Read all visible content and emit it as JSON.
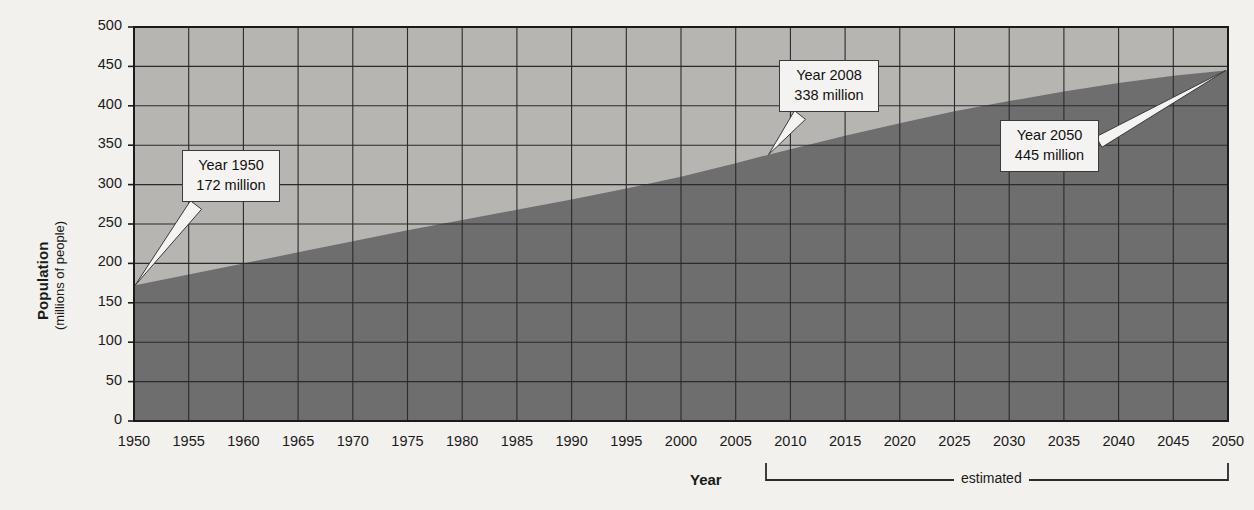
{
  "chart_data": {
    "type": "area",
    "title": "",
    "xlabel": "Year",
    "ylabel": "Population",
    "ylabel_sub": "(millions of people)",
    "xlim": [
      1950,
      2050
    ],
    "ylim": [
      0,
      500
    ],
    "grid": true,
    "legend": "none",
    "y_ticks": [
      "500",
      "450",
      "400",
      "350",
      "300",
      "250",
      "200",
      "150",
      "100",
      "50",
      "0"
    ],
    "y_tick_values": [
      500,
      450,
      400,
      350,
      300,
      250,
      200,
      150,
      100,
      50,
      0
    ],
    "x_ticks": [
      "1950",
      "1955",
      "1960",
      "1965",
      "1970",
      "1975",
      "1980",
      "1985",
      "1990",
      "1995",
      "2000",
      "2005",
      "2010",
      "2015",
      "2020",
      "2025",
      "2030",
      "2035",
      "2040",
      "2045",
      "2050"
    ],
    "x_tick_values": [
      1950,
      1955,
      1960,
      1965,
      1970,
      1975,
      1980,
      1985,
      1990,
      1995,
      2000,
      2005,
      2010,
      2015,
      2020,
      2025,
      2030,
      2035,
      2040,
      2045,
      2050
    ],
    "series": [
      {
        "name": "Population",
        "x": [
          1950,
          1955,
          1960,
          1965,
          1970,
          1975,
          1980,
          1985,
          1990,
          1995,
          2000,
          2005,
          2008,
          2010,
          2015,
          2020,
          2025,
          2030,
          2035,
          2040,
          2045,
          2050
        ],
        "values": [
          172,
          186,
          200,
          214,
          228,
          242,
          255,
          268,
          281,
          295,
          310,
          327,
          338,
          345,
          362,
          378,
          393,
          406,
          418,
          429,
          438,
          445
        ]
      }
    ],
    "annotations": [
      {
        "id": "callout-1950",
        "line1": "Year 1950",
        "line2": "172 million",
        "year": 1950,
        "value": 172
      },
      {
        "id": "callout-2008",
        "line1": "Year 2008",
        "line2": "338 million",
        "year": 2008,
        "value": 338
      },
      {
        "id": "callout-2050",
        "line1": "Year 2050",
        "line2": "445 million",
        "year": 2050,
        "value": 445
      }
    ],
    "estimated_bracket": {
      "label": "estimated",
      "from_year": 2008,
      "to_year": 2050
    },
    "colors": {
      "area_fill": "#6e6e6e",
      "plot_background": "#b6b5b2",
      "grid": "#2b2b2b",
      "axis": "#1a1a1a",
      "page_background": "#f2f1ee",
      "callout_background": "#f4f3f1",
      "text": "#1a1a1a"
    }
  }
}
